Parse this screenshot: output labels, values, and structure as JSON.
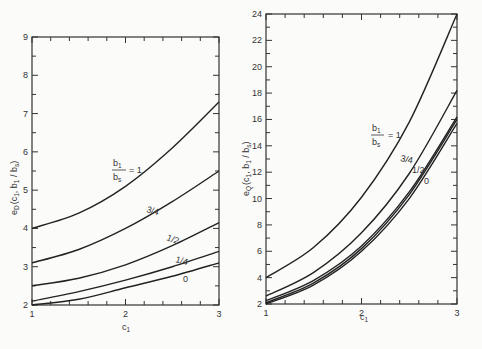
{
  "chart_data": [
    {
      "type": "line",
      "title": "",
      "xlabel": "c1",
      "ylabel": "e_D (c1, b1/bs)",
      "xlim": [
        1,
        3
      ],
      "ylim": [
        2,
        9
      ],
      "xticks": [
        "1",
        "2",
        "3"
      ],
      "yticks": [
        "2",
        "3",
        "4",
        "5",
        "6",
        "7",
        "8",
        "9"
      ],
      "grid": false,
      "x": [
        1,
        1.5,
        2,
        2.5,
        3
      ],
      "series": [
        {
          "name": "b1/bs = 1",
          "values": [
            4.0,
            4.4,
            5.1,
            6.1,
            7.3
          ]
        },
        {
          "name": "3/4",
          "values": [
            3.1,
            3.45,
            4.0,
            4.7,
            5.5
          ]
        },
        {
          "name": "1/2",
          "values": [
            2.5,
            2.7,
            3.05,
            3.55,
            4.15
          ]
        },
        {
          "name": "1/4",
          "values": [
            2.1,
            2.35,
            2.65,
            3.0,
            3.4
          ]
        },
        {
          "name": "0",
          "values": [
            1.95,
            2.15,
            2.45,
            2.75,
            3.1
          ]
        }
      ],
      "annotations": [
        {
          "text": "b1/bs = 1",
          "x": 2.45,
          "y": 5.6
        },
        {
          "text": "3/4",
          "x": 2.45,
          "y": 4.6
        },
        {
          "text": "1/2",
          "x": 2.5,
          "y": 3.75
        },
        {
          "text": "1/4",
          "x": 2.55,
          "y": 3.25
        },
        {
          "text": "0",
          "x": 2.65,
          "y": 2.7
        }
      ]
    },
    {
      "type": "line",
      "title": "",
      "xlabel": "c1",
      "ylabel": "e_Q (c1, b1/bs)",
      "xlim": [
        1,
        3
      ],
      "ylim": [
        2,
        24
      ],
      "xticks": [
        "1",
        "2",
        "3"
      ],
      "yticks": [
        "2",
        "4",
        "6",
        "8",
        "10",
        "12",
        "14",
        "16",
        "18",
        "20",
        "22",
        "24"
      ],
      "grid": false,
      "x": [
        1,
        1.5,
        2,
        2.5,
        3
      ],
      "series": [
        {
          "name": "b1/bs = 1",
          "values": [
            4.0,
            6.3,
            10.1,
            15.8,
            24.0
          ]
        },
        {
          "name": "3/4",
          "values": [
            2.6,
            4.4,
            7.4,
            11.9,
            18.2
          ]
        },
        {
          "name": "1/2",
          "values": [
            2.25,
            3.8,
            6.4,
            10.5,
            16.2
          ]
        },
        {
          "name": "1/4",
          "values": [
            2.1,
            3.6,
            6.2,
            10.3,
            16.0
          ]
        },
        {
          "name": "0",
          "values": [
            2.0,
            3.45,
            6.0,
            10.0,
            15.7
          ]
        }
      ],
      "annotations": [
        {
          "text": "b1/bs = 1",
          "x": 2.4,
          "y": 15.2
        },
        {
          "text": "3/4",
          "x": 2.55,
          "y": 12.7
        },
        {
          "text": "1/2",
          "x": 2.64,
          "y": 11.7
        },
        {
          "text": "0",
          "x": 2.68,
          "y": 10.9
        }
      ]
    }
  ],
  "labels": {
    "left": {
      "ylabel_main": "e",
      "ylabel_sub": "D",
      "ylabel_args": "(c",
      "ylabel_args_sub": "1",
      "ylabel_rest": ", b",
      "ylabel_rest_sub": "1",
      "ylabel_tail": " / b",
      "ylabel_tail_sub": "s",
      "ylabel_close": ")",
      "xlabel_main": "c",
      "xlabel_sub": "1",
      "ratio_num": "b",
      "ratio_num_sub": "1",
      "ratio_den": "b",
      "ratio_den_sub": "s",
      "ratio_eq": "= 1",
      "l34": "3/4",
      "l12": "1/2",
      "l14": "1/4",
      "l0": "0"
    },
    "right": {
      "ylabel_main": "e",
      "ylabel_sub": "Q",
      "ylabel_args": "(c",
      "ylabel_args_sub": "1",
      "ylabel_rest": ", b",
      "ylabel_rest_sub": "1",
      "ylabel_tail": " / b",
      "ylabel_tail_sub": "s",
      "ylabel_close": ")",
      "xlabel_main": "c",
      "xlabel_sub": "1",
      "ratio_num": "b",
      "ratio_num_sub": "1",
      "ratio_den": "b",
      "ratio_den_sub": "s",
      "ratio_eq": "= 1",
      "l34": "3/4",
      "l12": "1/2",
      "l0": "0"
    }
  },
  "colors": {
    "line": "#222222",
    "background": "#fbfbfa"
  }
}
